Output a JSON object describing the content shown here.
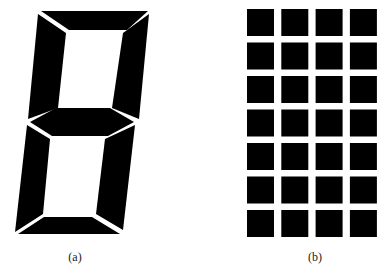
{
  "figure": {
    "panels": [
      {
        "id": "a",
        "label": "(a)",
        "description": "seven-segment display"
      },
      {
        "id": "b",
        "label": "(b)",
        "description": "dot-matrix display, 4 columns x 7 rows"
      }
    ],
    "dot_matrix": {
      "columns": 4,
      "rows": 7
    },
    "colors": {
      "segment": "#000000",
      "background": "#ffffff"
    }
  }
}
